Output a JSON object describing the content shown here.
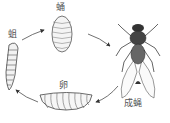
{
  "diagram": {
    "stages": [
      {
        "id": "pupa",
        "label": "蛹"
      },
      {
        "id": "larva",
        "label": "蛆"
      },
      {
        "id": "egg",
        "label": "卵"
      },
      {
        "id": "adult",
        "label": "成蝇"
      }
    ],
    "cycle_order": [
      "larva",
      "pupa",
      "adult",
      "egg",
      "larva"
    ]
  }
}
